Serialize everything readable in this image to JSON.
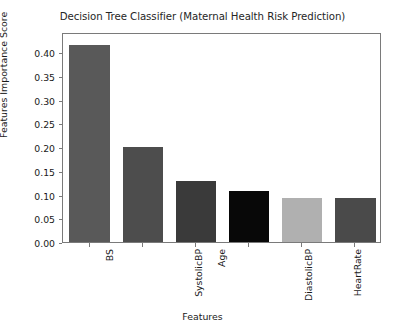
{
  "chart_data": {
    "type": "bar",
    "title": "Decision Tree Classifier (Maternal Health Risk Prediction)",
    "xlabel": "Features",
    "ylabel": "Features Importance Score",
    "categories": [
      "BS",
      "SystolicBP",
      "Age",
      "DiastolicBP",
      "HeartRate",
      "BodyTemp"
    ],
    "values": [
      0.415,
      0.2,
      0.128,
      0.107,
      0.093,
      0.092
    ],
    "bar_colors": [
      "#595959",
      "#4d4d4d",
      "#3a3a3a",
      "#080808",
      "#b0b0b0",
      "#4a4a4a"
    ],
    "ylim": [
      0.0,
      0.4429
    ],
    "yticks": [
      0.0,
      0.05,
      0.1,
      0.15,
      0.2,
      0.25,
      0.3,
      0.35,
      0.4
    ],
    "ytick_labels": [
      "0.00",
      "0.05",
      "0.10",
      "0.15",
      "0.20",
      "0.25",
      "0.30",
      "0.35",
      "0.40"
    ],
    "grid": false,
    "legend": null
  },
  "figure": {
    "background_color": "#ffffff",
    "axis_color": "#7a7a7a",
    "text_color": "#1a1a1a"
  }
}
